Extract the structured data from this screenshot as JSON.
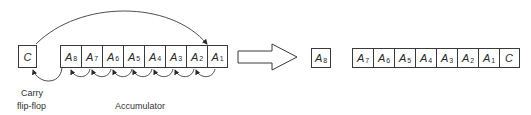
{
  "diagram": {
    "before": {
      "carry_cell": {
        "letter": "C",
        "sub": ""
      },
      "accumulator_cells": [
        {
          "letter": "A",
          "sub": "8"
        },
        {
          "letter": "A",
          "sub": "7"
        },
        {
          "letter": "A",
          "sub": "6"
        },
        {
          "letter": "A",
          "sub": "5"
        },
        {
          "letter": "A",
          "sub": "4"
        },
        {
          "letter": "A",
          "sub": "3"
        },
        {
          "letter": "A",
          "sub": "2"
        },
        {
          "letter": "A",
          "sub": "1"
        }
      ],
      "labels": {
        "carry_line1": "Carry",
        "carry_line2": "flip-flop",
        "accumulator": "Accumulator"
      }
    },
    "after": {
      "single_cell": {
        "letter": "A",
        "sub": "8"
      },
      "register_cells": [
        {
          "letter": "A",
          "sub": "7"
        },
        {
          "letter": "A",
          "sub": "6"
        },
        {
          "letter": "A",
          "sub": "5"
        },
        {
          "letter": "A",
          "sub": "4"
        },
        {
          "letter": "A",
          "sub": "3"
        },
        {
          "letter": "A",
          "sub": "2"
        },
        {
          "letter": "A",
          "sub": "1"
        },
        {
          "letter": "C",
          "sub": ""
        }
      ]
    },
    "colors": {
      "stroke": "#3a3a3a",
      "background": "#ffffff",
      "text": "#2a2a2a"
    }
  }
}
